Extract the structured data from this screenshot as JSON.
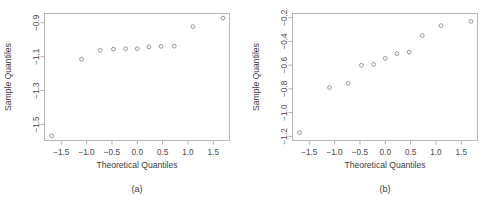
{
  "figure": {
    "panels": [
      {
        "id": "a",
        "caption": "(a)",
        "xlabel": "Theoretical Quantiles",
        "ylabel": "Sample Quantiles",
        "xticks": [
          "-1.5",
          "-1.0",
          "-0.5",
          "0.0",
          "0.5",
          "1.0",
          "1.5"
        ],
        "yticks": [
          "-0.9",
          "-1.1",
          "-1.3",
          "-1.5"
        ]
      },
      {
        "id": "b",
        "caption": "(b)",
        "xlabel": "Theoretical Quantiles",
        "ylabel": "Sample Quantiles",
        "xticks": [
          "-1.5",
          "-1.0",
          "-0.5",
          "0.0",
          "0.5",
          "1.0",
          "1.5"
        ],
        "yticks": [
          "-0.2",
          "-0.4",
          "-0.6",
          "-0.8",
          "-1.0",
          "-1.2"
        ]
      }
    ]
  },
  "chart_data": [
    {
      "type": "scatter",
      "title": "(a)",
      "xlabel": "Theoretical Quantiles",
      "ylabel": "Sample Quantiles",
      "xlim": [
        -1.83,
        1.82
      ],
      "ylim": [
        -1.595,
        -0.845
      ],
      "xticks": [
        -1.5,
        -1.0,
        -0.5,
        0.0,
        0.5,
        1.0,
        1.5
      ],
      "yticks": [
        -0.9,
        -1.1,
        -1.3,
        -1.5
      ],
      "grid": false,
      "legend": null,
      "marker": "open-circle",
      "x": [
        -1.69,
        -1.1,
        -0.73,
        -0.47,
        -0.23,
        0.0,
        0.23,
        0.47,
        0.73,
        1.1,
        1.69
      ],
      "y": [
        -1.567,
        -1.115,
        -1.063,
        -1.055,
        -1.053,
        -1.053,
        -1.042,
        -1.039,
        -1.038,
        -0.922,
        -0.872
      ]
    },
    {
      "type": "scatter",
      "title": "(b)",
      "xlabel": "Theoretical Quantiles",
      "ylabel": "Sample Quantiles",
      "xlim": [
        -1.83,
        1.82
      ],
      "ylim": [
        -1.235,
        -0.165
      ],
      "xticks": [
        -1.5,
        -1.0,
        -0.5,
        0.0,
        0.5,
        1.0,
        1.5
      ],
      "yticks": [
        -0.2,
        -0.4,
        -0.6,
        -0.8,
        -1.0,
        -1.2
      ],
      "grid": false,
      "legend": null,
      "marker": "open-circle",
      "x": [
        -1.69,
        -1.1,
        -0.73,
        -0.47,
        -0.23,
        0.0,
        0.23,
        0.47,
        0.73,
        1.1,
        1.69
      ],
      "y": [
        -1.168,
        -0.788,
        -0.753,
        -0.601,
        -0.594,
        -0.543,
        -0.503,
        -0.491,
        -0.351,
        -0.267,
        -0.232
      ]
    }
  ]
}
